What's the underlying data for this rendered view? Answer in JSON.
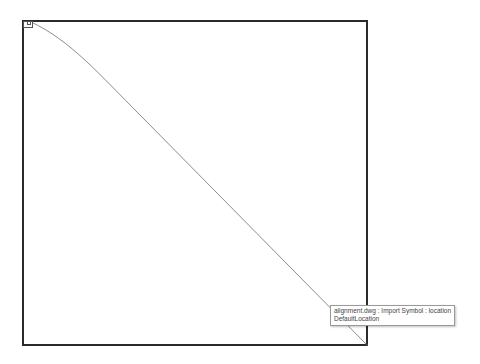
{
  "drawing": {
    "frame_color": "#2b2b2b",
    "alignment_line_color": "#6e6e6e"
  },
  "tooltip": {
    "line1": "alignment.dwg : Import Symbol : location",
    "line2": "DefaultLocation"
  }
}
